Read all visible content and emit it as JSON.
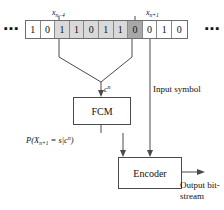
{
  "diagram": {
    "tape": {
      "name": "bit-sequence-tape",
      "left_ellipsis": "▪▪▪",
      "right_ellipsis": "▪▪▪",
      "cells": [
        {
          "bit": "1",
          "shade": "none"
        },
        {
          "bit": "0",
          "shade": "none"
        },
        {
          "bit": "1",
          "shade": "light"
        },
        {
          "bit": "1",
          "shade": "light"
        },
        {
          "bit": "0",
          "shade": "light"
        },
        {
          "bit": "1",
          "shade": "light"
        },
        {
          "bit": "1",
          "shade": "light"
        },
        {
          "bit": "0",
          "shade": "dark"
        },
        {
          "bit": "0",
          "shade": "none"
        },
        {
          "bit": "1",
          "shade": "none"
        },
        {
          "bit": "0",
          "shade": "none"
        }
      ]
    },
    "labels": {
      "left_pointer_base": "x",
      "left_pointer_sub": "n−4",
      "right_pointer_base": "x",
      "right_pointer_sub": "n+1",
      "context_base": "c",
      "context_sup": "n",
      "probability": "P(X",
      "probability_sub": "n+1",
      "probability_mid": " = s|c",
      "probability_sup": "n",
      "probability_end": ")",
      "input_symbol": "Input symbol",
      "output_bitstream": "Output bit-stream"
    },
    "boxes": {
      "fcm": "FCM",
      "encoder": "Encoder"
    },
    "colors": {
      "stroke": "#4a4a4a",
      "cell_border": "#8a8a8a",
      "shade_light": "#d9d9d9",
      "shade_dark": "#a8a8a8",
      "background": "#ffffff"
    }
  }
}
